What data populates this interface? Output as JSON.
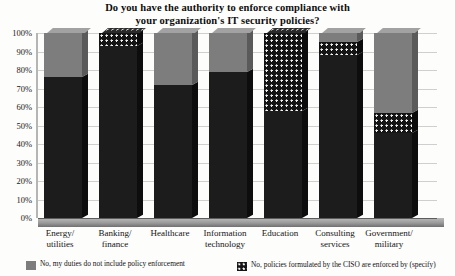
{
  "chart_data": {
    "type": "bar",
    "subtype": "stacked-column-3d",
    "title": "Do you have the authority to enforce compliance with your organization's IT security policies?",
    "title_lines": [
      "Do you have the authority to enforce compliance with",
      "your organization's IT security policies?"
    ],
    "xlabel": "",
    "ylabel": "",
    "ylim": [
      0,
      100
    ],
    "ytick_labels": [
      "0%",
      "10%",
      "20%",
      "30%",
      "40%",
      "50%",
      "60%",
      "70%",
      "80%",
      "90%",
      "100%"
    ],
    "ytick_values": [
      0,
      10,
      20,
      30,
      40,
      50,
      60,
      70,
      80,
      90,
      100
    ],
    "grid": true,
    "legend_position": "bottom",
    "units": "percent",
    "stack_total": 100,
    "categories": [
      "Energy/ utilities",
      "Banking/ finance",
      "Healthcare",
      "Information technology",
      "Education",
      "Consulting services",
      "Government/ military"
    ],
    "category_lines": [
      [
        "Energy/",
        "utilities"
      ],
      [
        "Banking/",
        "finance"
      ],
      [
        "Healthcare",
        ""
      ],
      [
        "Information",
        "technology"
      ],
      [
        "Education",
        ""
      ],
      [
        "Consulting",
        "services"
      ],
      [
        "Government/",
        "military"
      ]
    ],
    "series": [
      {
        "name": "Yes",
        "key": "yes",
        "fill": "dark",
        "color": "#1c1c1c",
        "in_legend": false,
        "values": [
          76,
          93,
          72,
          79,
          58,
          88,
          46
        ]
      },
      {
        "name": "No, policies formulated by the CISO are enforced by (specify)",
        "key": "ciso",
        "fill": "dots",
        "color": "#141414",
        "in_legend": true,
        "values": [
          0,
          7,
          0,
          0,
          42,
          7,
          11
        ]
      },
      {
        "name": "No, my duties do not include policy enforcement",
        "key": "no_duties",
        "fill": "gray",
        "color": "#7d7d7d",
        "in_legend": true,
        "values": [
          24,
          0,
          28,
          21,
          0,
          5,
          43
        ]
      }
    ]
  },
  "legend": {
    "items": [
      {
        "swatch": "gray",
        "label": "No, my duties do not include policy enforcement"
      },
      {
        "swatch": "dots",
        "label": "No, policies formulated by the CISO are enforced by (specify)"
      }
    ]
  },
  "colors": {
    "dark": "#1c1c1c",
    "gray": "#7d7d7d",
    "dots_bg": "#141414",
    "dots_fg": "#f4f4f4",
    "grid": "#cfcfcf",
    "background": "#fdfdfb"
  }
}
